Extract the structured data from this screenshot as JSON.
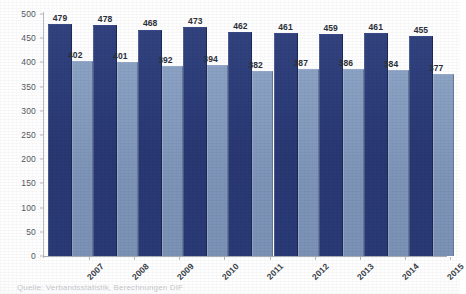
{
  "chart_data": {
    "type": "bar",
    "title": "",
    "subtitle": "",
    "xlabel": "",
    "ylabel": "",
    "categories": [
      "2007",
      "2008",
      "2009",
      "2010",
      "2011",
      "2012",
      "2013",
      "2014",
      "2015"
    ],
    "series": [
      {
        "name": "series-a",
        "color": "#2a3a76",
        "values": [
          479,
          478,
          468,
          473,
          462,
          461,
          459,
          461,
          455
        ]
      },
      {
        "name": "series-b",
        "color": "#7d94b8",
        "values": [
          402,
          401,
          392,
          394,
          382,
          387,
          386,
          384,
          377
        ]
      }
    ],
    "ylim": [
      0,
      500
    ],
    "ytick_labels": [
      "500",
      "450",
      "400",
      "350",
      "300",
      "250",
      "200",
      "150",
      "100",
      "50",
      "0"
    ],
    "ytick_values": [
      500,
      450,
      400,
      350,
      300,
      250,
      200,
      150,
      100,
      50,
      0
    ],
    "ytick_step": 50,
    "grid": false,
    "data_labels": true,
    "legend": "none",
    "orientation": "vertical",
    "grouping": "grouped"
  },
  "figure": {
    "caption": "Quelle: Verbandsstatistik, Berechnungen DIF",
    "background_color": "#ffffff",
    "axis_color": "#b5b9c1",
    "label_color": "#3a3f48"
  }
}
